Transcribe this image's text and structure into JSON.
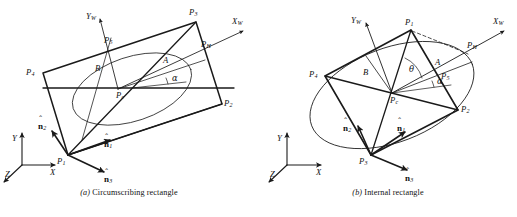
{
  "figure": {
    "background_color": "#ffffff",
    "stroke_color": "#1a1a1a",
    "panels": [
      {
        "id": "a",
        "caption_index": "(a)",
        "caption_text": "Circumscribing rectangle",
        "labels": {
          "axis_xw": "X",
          "axis_xw_sub": "W",
          "axis_yw": "Y",
          "axis_yw_sub": "W",
          "axis_x": "X",
          "axis_y": "Y",
          "axis_z": "Z",
          "p1": "P",
          "p1_sub": "1",
          "p2": "P",
          "p2_sub": "2",
          "p3": "P",
          "p3_sub": "3",
          "p4": "P",
          "p4_sub": "4",
          "p5": "P",
          "p5_sub": "5",
          "ph": "P",
          "ph_sub": "H",
          "pc": "P",
          "pc_sub": "c",
          "semi_major": "A",
          "semi_minor": "B",
          "alpha": "α",
          "n1": "n",
          "n1_sub": "1",
          "n2": "n",
          "n2_sub": "2",
          "n3": "n",
          "n3_sub": "3",
          "hat": "ˆ"
        }
      },
      {
        "id": "b",
        "caption_index": "(b)",
        "caption_text": "Internal rectangle",
        "labels": {
          "axis_xw": "X",
          "axis_xw_sub": "W",
          "axis_yw": "Y",
          "axis_yw_sub": "W",
          "axis_x": "X",
          "axis_y": "Y",
          "axis_z": "Z",
          "p1": "P",
          "p1_sub": "1",
          "p2": "P",
          "p2_sub": "2",
          "p3": "P",
          "p3_sub": "3",
          "p4": "P",
          "p4_sub": "4",
          "p5": "P",
          "p5_sub": "5",
          "ph": "P",
          "ph_sub": "H",
          "pc": "P",
          "pc_sub": "c",
          "semi_major": "A",
          "semi_minor": "B",
          "alpha": "α",
          "theta": "θ",
          "n1": "n",
          "n1_sub": "1",
          "n2": "n",
          "n2_sub": "2",
          "n3": "n",
          "n3_sub": "3",
          "hat": "ˆ"
        }
      }
    ]
  }
}
